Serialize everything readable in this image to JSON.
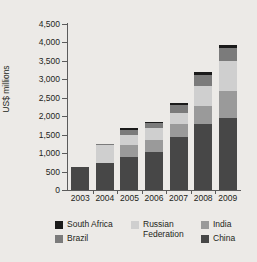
{
  "chart_data": {
    "type": "bar",
    "stacked": true,
    "title": "",
    "subtitle": "",
    "xlabel": "",
    "ylabel": "US$ millions",
    "categories": [
      "2003",
      "2004",
      "2005",
      "2006",
      "2007",
      "2008",
      "2009"
    ],
    "ylim": [
      0,
      4500
    ],
    "y_ticks": [
      "0",
      "500",
      "1,000",
      "1,500",
      "2,000",
      "2,500",
      "3,000",
      "3,500",
      "4,000",
      "4,500"
    ],
    "y_tick_values": [
      0,
      500,
      1000,
      1500,
      2000,
      2500,
      3000,
      3500,
      4000,
      4500
    ],
    "grid": false,
    "legend_position": "bottom",
    "stack_order_bottom_to_top": [
      "China",
      "India",
      "Russian Federation",
      "Brazil",
      "South Africa"
    ],
    "series": [
      {
        "name": "China",
        "color": "#474747",
        "values": [
          625,
          720,
          900,
          1020,
          1450,
          1800,
          1950
        ]
      },
      {
        "name": "India",
        "color": "#9a9a9a",
        "values": [
          0,
          0,
          330,
          330,
          340,
          490,
          730
        ]
      },
      {
        "name": "Russian Federation",
        "color": "#cfcfcf",
        "values": [
          0,
          510,
          250,
          330,
          300,
          520,
          830
        ]
      },
      {
        "name": "Brazil",
        "color": "#7b7b7b",
        "values": [
          0,
          20,
          155,
          130,
          220,
          320,
          350
        ]
      },
      {
        "name": "South Africa",
        "color": "#1a1a1a",
        "values": [
          0,
          0,
          35,
          30,
          40,
          70,
          60
        ]
      }
    ],
    "totals": [
      625,
      1250,
      1670,
      1830,
      2350,
      3200,
      3920
    ]
  },
  "legend": {
    "columns": [
      {
        "items": [
          {
            "label": "South Africa",
            "color": "#1a1a1a",
            "swatch_name": "legend-swatch-south-africa"
          },
          {
            "label": "Brazil",
            "color": "#7b7b7b",
            "swatch_name": "legend-swatch-brazil"
          }
        ]
      },
      {
        "items": [
          {
            "label": "Russian\nFederation",
            "color": "#cfcfcf",
            "swatch_name": "legend-swatch-russian-federation"
          }
        ]
      },
      {
        "items": [
          {
            "label": "India",
            "color": "#9a9a9a",
            "swatch_name": "legend-swatch-india"
          },
          {
            "label": "China",
            "color": "#474747",
            "swatch_name": "legend-swatch-china"
          }
        ]
      }
    ]
  },
  "colors": {
    "background": "#eceae7",
    "plot_background": "#f3f1ee",
    "axis": "#5b5b5b",
    "text": "#231f20"
  }
}
